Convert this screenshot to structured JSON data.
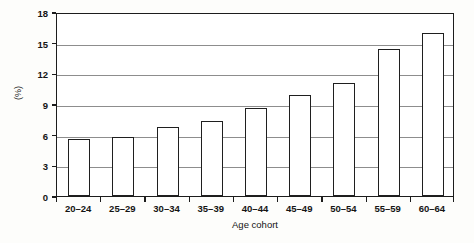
{
  "chart_data": {
    "type": "bar",
    "title": "",
    "xlabel": "Age cohort",
    "ylabel": "(%)",
    "categories": [
      "20–24",
      "25–29",
      "30–34",
      "35–39",
      "40–44",
      "45–49",
      "50–54",
      "55–59",
      "60–64"
    ],
    "values": [
      5.6,
      5.8,
      6.8,
      7.3,
      8.6,
      9.9,
      11.1,
      14.4,
      15.9
    ],
    "ylim": [
      0,
      18
    ],
    "yticks": [
      0,
      3,
      6,
      9,
      12,
      15,
      18
    ],
    "ytick_labels": [
      "0",
      "3",
      "6",
      "9",
      "12",
      "15",
      "18"
    ],
    "grid": "horizontal",
    "legend": "none",
    "bar_fill_color": "#ffffff",
    "bar_edge_color": "#1f1f1f",
    "gridline_color": "#8d8d8d",
    "axis_color": "#1c1c1c"
  }
}
